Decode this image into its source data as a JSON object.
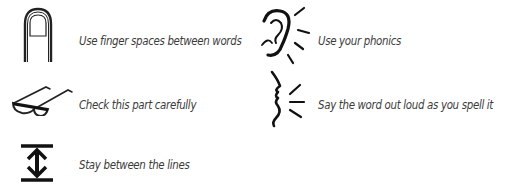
{
  "items": [
    {
      "icon": "finger-icon",
      "label": "Use finger spaces between words"
    },
    {
      "icon": "ear-icon",
      "label": "Use your phonics"
    },
    {
      "icon": "glasses-icon",
      "label": "Check this part carefully"
    },
    {
      "icon": "speaking-face-icon",
      "label": "Say the word out loud as you spell it"
    },
    {
      "icon": "between-lines-icon",
      "label": "Stay between the lines"
    }
  ]
}
